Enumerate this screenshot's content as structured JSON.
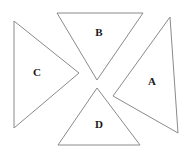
{
  "figure": {
    "background_color": "#ffffff",
    "stroke_color": "#8a8a8a",
    "label_color": "#1a1a1a",
    "width": 190,
    "height": 156,
    "triangles": [
      {
        "id": "triangle-a",
        "label": "A",
        "orientation": "points-left",
        "label_x": 152,
        "label_y": 82,
        "points": "113,96 170,17 178,133"
      },
      {
        "id": "triangle-b",
        "label": "B",
        "orientation": "points-down",
        "label_x": 99,
        "label_y": 33,
        "points": "97,80 57,13 143,13"
      },
      {
        "id": "triangle-c",
        "label": "C",
        "orientation": "points-right",
        "label_x": 37,
        "label_y": 73,
        "points": "79,73 14,21 14,128"
      },
      {
        "id": "triangle-d",
        "label": "D",
        "orientation": "points-up",
        "label_x": 99,
        "label_y": 125,
        "points": "97,88 58,145 140,145"
      }
    ]
  }
}
